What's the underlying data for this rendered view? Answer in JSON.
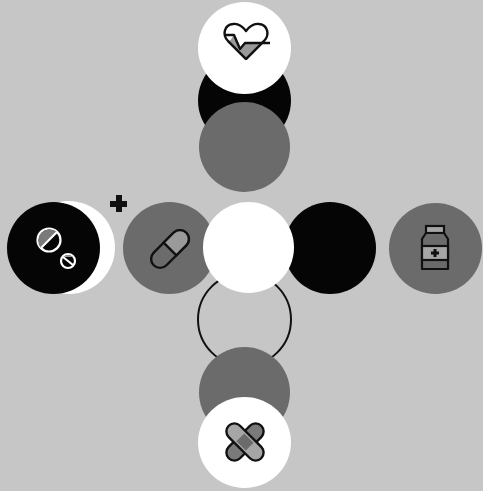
{
  "corner_text": "",
  "colors": {
    "background": "#c6c6c6",
    "white": "#ffffff",
    "black": "#050505",
    "gray": "#6b6b6b",
    "icon_fill": "#9a9a9a",
    "icon_stroke": "#111111"
  },
  "nodes": [
    {
      "id": "top",
      "icon": "heart-pulse-icon",
      "label": "Heart rate"
    },
    {
      "id": "left",
      "icon": "pills-icon",
      "label": "Pills"
    },
    {
      "id": "left-inner",
      "icon": "capsule-icon",
      "label": "Capsule"
    },
    {
      "id": "right",
      "icon": "medicine-bottle-icon",
      "label": "Medicine bottle"
    },
    {
      "id": "bottom",
      "icon": "bandage-icon",
      "label": "Bandage"
    }
  ]
}
